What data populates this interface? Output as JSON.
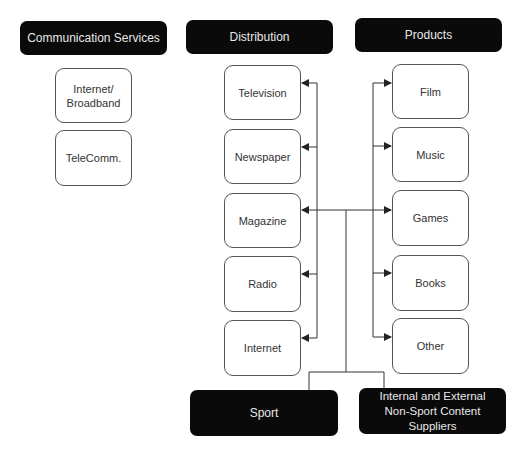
{
  "headers": {
    "communication": "Communication Services",
    "distribution": "Distribution",
    "products": "Products",
    "sport": "Sport",
    "suppliers_line1": "Internal and External",
    "suppliers_line2": "Non-Sport Content Suppliers"
  },
  "communication_services": [
    {
      "line1": "Internet/",
      "line2": "Broadband"
    },
    {
      "line1": "TeleComm.",
      "line2": ""
    }
  ],
  "distribution": [
    "Television",
    "Newspaper",
    "Magazine",
    "Radio",
    "Internet"
  ],
  "products": [
    "Film",
    "Music",
    "Games",
    "Books",
    "Other"
  ],
  "colors": {
    "header_bg": "#0a0a0a",
    "header_text": "#e8e8e8",
    "node_border": "#555555",
    "line": "#333333"
  }
}
